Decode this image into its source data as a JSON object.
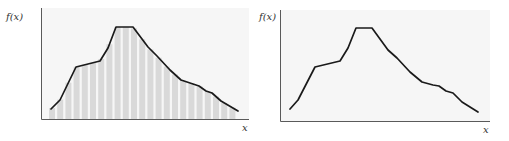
{
  "chart_data": [
    {
      "type": "area",
      "title": "",
      "ylabel": "f(x)",
      "xlabel": "x",
      "style": "curve with vertical bar (Riemann-sum style) shading under it",
      "grid": false,
      "legend": null,
      "bar_fill": "#d9d9d9",
      "curve_color": "#1a1a1a",
      "frame": {
        "x0": 41,
        "y_top": 8,
        "y_axis": 119,
        "x_end": 249
      },
      "points": [
        [
          51,
          109
        ],
        [
          60,
          100
        ],
        [
          76,
          67
        ],
        [
          100,
          61
        ],
        [
          108,
          48
        ],
        [
          116,
          27
        ],
        [
          133,
          27
        ],
        [
          148,
          47
        ],
        [
          157,
          56
        ],
        [
          170,
          70
        ],
        [
          181,
          80
        ],
        [
          193,
          84
        ],
        [
          199,
          86
        ],
        [
          206,
          91
        ],
        [
          212,
          93
        ],
        [
          221,
          101
        ],
        [
          238,
          111
        ]
      ]
    },
    {
      "type": "line",
      "title": "",
      "ylabel": "f(x)",
      "xlabel": "x",
      "grid": false,
      "legend": null,
      "curve_color": "#1a1a1a",
      "frame": {
        "x0": 280,
        "y_top": 10,
        "y_axis": 121,
        "x_end": 490
      },
      "points": [
        [
          290,
          109
        ],
        [
          298,
          100
        ],
        [
          315,
          67
        ],
        [
          340,
          61
        ],
        [
          348,
          48
        ],
        [
          356,
          28
        ],
        [
          372,
          28
        ],
        [
          388,
          50
        ],
        [
          397,
          58
        ],
        [
          410,
          72
        ],
        [
          422,
          82
        ],
        [
          433,
          85
        ],
        [
          439,
          86
        ],
        [
          446,
          91
        ],
        [
          453,
          93
        ],
        [
          462,
          102
        ],
        [
          478,
          112
        ]
      ]
    }
  ],
  "labels": {
    "left_y": "f(x)",
    "left_x": "x",
    "right_y": "f(x)",
    "right_x": "x"
  }
}
